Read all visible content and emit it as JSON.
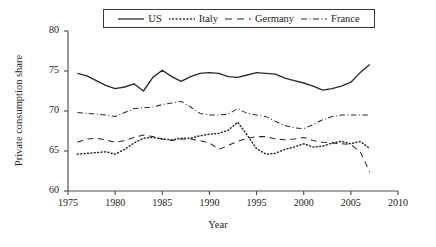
{
  "chart_data": {
    "type": "line",
    "title": "",
    "xlabel": "Year",
    "ylabel": "Private consumption share",
    "xlim": [
      1975,
      2010
    ],
    "ylim": [
      60,
      80
    ],
    "xticks": [
      1975,
      1980,
      1985,
      1990,
      1995,
      2000,
      2005,
      2010
    ],
    "xtick_labels": [
      "1975",
      "1980",
      "1985",
      "1990",
      "1995",
      "2000",
      "2005",
      "2010"
    ],
    "yticks": [
      60,
      65,
      70,
      75,
      80
    ],
    "ytick_labels": [
      "60",
      "65",
      "70",
      "75",
      "80"
    ],
    "grid": false,
    "legend_position": "top-center",
    "x": [
      1976,
      1977,
      1978,
      1979,
      1980,
      1981,
      1982,
      1983,
      1984,
      1985,
      1986,
      1987,
      1988,
      1989,
      1990,
      1991,
      1992,
      1993,
      1994,
      1995,
      1996,
      1997,
      1998,
      1999,
      2000,
      2001,
      2002,
      2003,
      2004,
      2005,
      2006,
      2007
    ],
    "series": [
      {
        "name": "US",
        "dash": "solid",
        "color": "#2b2b2b",
        "values": [
          74.7,
          74.4,
          73.8,
          73.2,
          72.8,
          73.0,
          73.4,
          72.5,
          74.2,
          75.1,
          74.3,
          73.7,
          74.3,
          74.7,
          74.8,
          74.7,
          74.3,
          74.2,
          74.5,
          74.8,
          74.7,
          74.6,
          74.1,
          73.8,
          73.5,
          73.1,
          72.6,
          72.8,
          73.1,
          73.6,
          74.8,
          75.8
        ]
      },
      {
        "name": "Italy",
        "dash": "dotted",
        "color": "#2b2b2b",
        "values": [
          64.6,
          64.7,
          64.8,
          64.9,
          64.6,
          65.2,
          66.0,
          66.6,
          66.7,
          66.5,
          66.4,
          66.6,
          66.6,
          66.9,
          67.1,
          67.2,
          67.6,
          68.6,
          67.0,
          65.3,
          64.6,
          64.7,
          65.2,
          65.5,
          65.9,
          65.5,
          65.6,
          66.0,
          66.2,
          65.9,
          66.2,
          65.3
        ]
      },
      {
        "name": "Germany",
        "dash": "dashed",
        "color": "#2b2b2b",
        "values": [
          66.1,
          66.5,
          66.6,
          66.4,
          66.1,
          66.3,
          66.7,
          67.0,
          66.8,
          66.5,
          66.3,
          66.5,
          66.5,
          66.3,
          66.0,
          65.2,
          65.7,
          66.2,
          66.6,
          66.8,
          66.8,
          66.5,
          66.4,
          66.5,
          66.7,
          66.3,
          66.1,
          66.0,
          65.9,
          65.8,
          64.9,
          62.4
        ]
      },
      {
        "name": "France",
        "dash": "dashdot",
        "color": "#2b2b2b",
        "values": [
          69.8,
          69.7,
          69.6,
          69.5,
          69.3,
          69.8,
          70.3,
          70.4,
          70.5,
          70.8,
          71.0,
          71.2,
          70.5,
          69.7,
          69.5,
          69.5,
          69.6,
          70.3,
          69.7,
          69.5,
          69.3,
          68.7,
          68.2,
          67.9,
          67.8,
          68.3,
          68.9,
          69.3,
          69.5,
          69.5,
          69.5,
          69.5
        ]
      }
    ]
  },
  "legend": {
    "items": [
      {
        "label": "US",
        "style": "solid"
      },
      {
        "label": "Italy",
        "style": "dotted"
      },
      {
        "label": "Germany",
        "style": "dashed"
      },
      {
        "label": "France",
        "style": "dashdot"
      }
    ]
  }
}
